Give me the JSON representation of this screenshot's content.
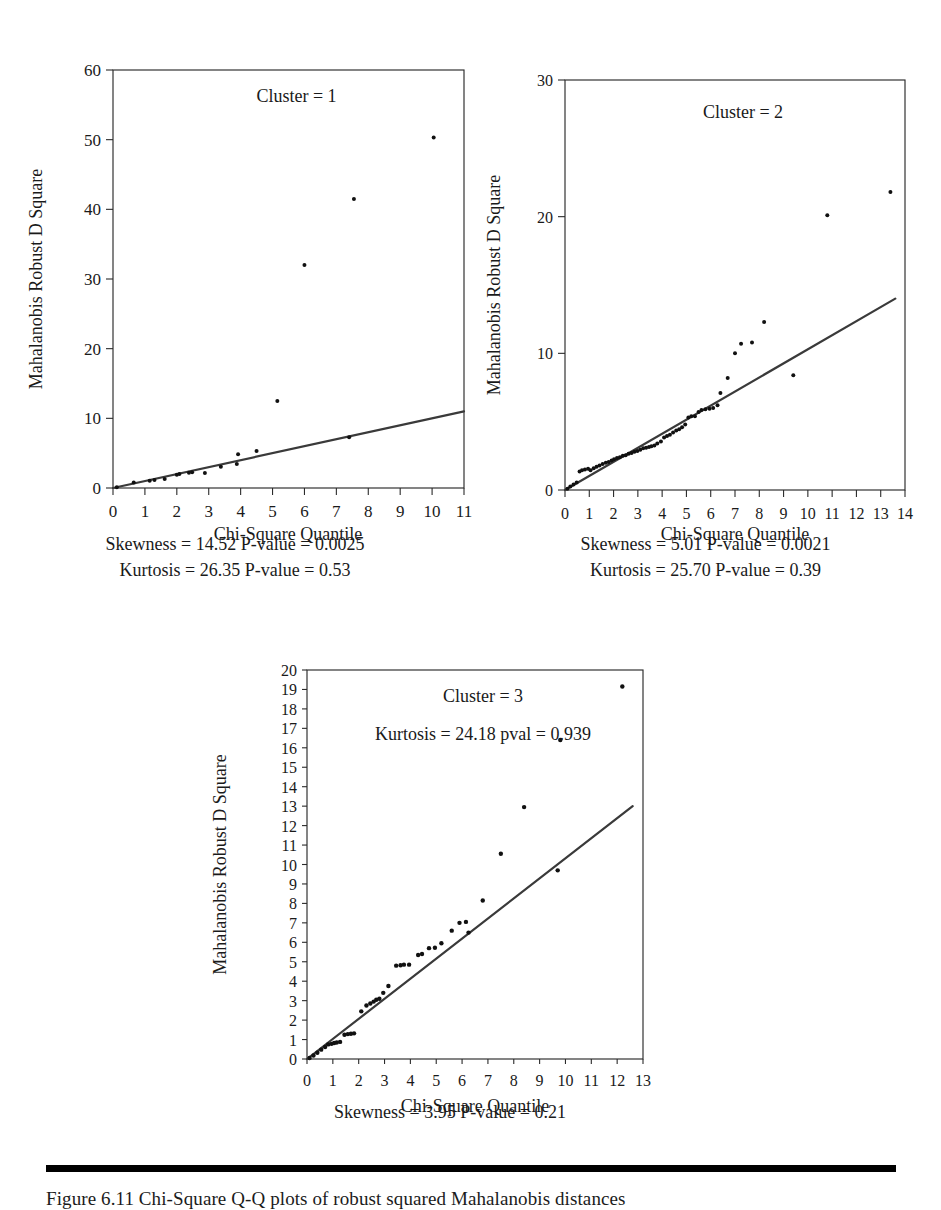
{
  "figure": {
    "background_color": "#ffffff",
    "ink_color": "#1a1a1a",
    "point_color": "#111111",
    "line_color": "#3a3a3a",
    "caption_rule_color": "#000000",
    "caption_text": "Figure 6.11   Chi-Square Q-Q plots of robust squared Mahalanobis distances"
  },
  "chart_data": [
    {
      "id": "cluster-1",
      "type": "scatter",
      "title": "Cluster = 1",
      "xlabel": "Chi-Square Quantile",
      "ylabel": "Mahalanobis Robust D Square",
      "xlim": [
        0,
        11
      ],
      "ylim": [
        0,
        60
      ],
      "xticks": [
        0,
        1,
        2,
        3,
        4,
        5,
        6,
        7,
        8,
        9,
        10,
        11
      ],
      "xtick_labels": [
        "0",
        "1",
        "2",
        "3",
        "4",
        "5",
        "6",
        "7",
        "8",
        "9",
        "10",
        "11"
      ],
      "yticks": [
        0,
        10,
        20,
        30,
        40,
        50,
        60
      ],
      "ytick_labels": [
        "0",
        "10",
        "20",
        "30",
        "40",
        "50",
        "60"
      ],
      "grid": false,
      "legend": "none",
      "reference_line": {
        "x": [
          0,
          11
        ],
        "y": [
          0,
          11
        ],
        "label": "45-degree reference line"
      },
      "points": [
        {
          "x": 0.12,
          "y": 0.1
        },
        {
          "x": 0.65,
          "y": 0.8
        },
        {
          "x": 1.15,
          "y": 1.05
        },
        {
          "x": 1.3,
          "y": 1.15
        },
        {
          "x": 1.62,
          "y": 1.3
        },
        {
          "x": 2.0,
          "y": 1.9
        },
        {
          "x": 2.08,
          "y": 2.0
        },
        {
          "x": 2.38,
          "y": 2.2
        },
        {
          "x": 2.48,
          "y": 2.25
        },
        {
          "x": 2.88,
          "y": 2.15
        },
        {
          "x": 3.38,
          "y": 3.05
        },
        {
          "x": 3.88,
          "y": 3.45
        },
        {
          "x": 3.92,
          "y": 4.85
        },
        {
          "x": 4.5,
          "y": 5.3
        },
        {
          "x": 5.15,
          "y": 12.5
        },
        {
          "x": 6.0,
          "y": 32.0
        },
        {
          "x": 7.4,
          "y": 7.3
        },
        {
          "x": 7.55,
          "y": 41.5
        },
        {
          "x": 10.05,
          "y": 50.3
        }
      ],
      "annotations": [
        {
          "text": "Skewness = 14.52   P-value = 0.0025"
        },
        {
          "text": "Kurtosis = 26.35   P-value = 0.53"
        }
      ]
    },
    {
      "id": "cluster-2",
      "type": "scatter",
      "title": "Cluster = 2",
      "xlabel": "Chi-Square Quantile",
      "ylabel": "Mahalanobis Robust D Square",
      "xlim": [
        0,
        14
      ],
      "ylim": [
        0,
        30
      ],
      "xticks": [
        0,
        1,
        2,
        3,
        4,
        5,
        6,
        7,
        8,
        9,
        10,
        11,
        12,
        13,
        14
      ],
      "xtick_labels": [
        "0",
        "1",
        "2",
        "3",
        "4",
        "5",
        "6",
        "7",
        "8",
        "9",
        "10",
        "11",
        "12",
        "13",
        "14"
      ],
      "yticks": [
        0,
        10,
        20,
        30
      ],
      "ytick_labels": [
        "0",
        "10",
        "20",
        "30"
      ],
      "grid": false,
      "legend": "none",
      "reference_line": {
        "x": [
          0,
          13.6
        ],
        "y": [
          0,
          14.0
        ],
        "label": "45-degree reference line"
      },
      "points": [
        {
          "x": 0.1,
          "y": 0.1
        },
        {
          "x": 0.22,
          "y": 0.25
        },
        {
          "x": 0.35,
          "y": 0.4
        },
        {
          "x": 0.48,
          "y": 0.55
        },
        {
          "x": 0.6,
          "y": 1.35
        },
        {
          "x": 0.7,
          "y": 1.45
        },
        {
          "x": 0.82,
          "y": 1.5
        },
        {
          "x": 0.95,
          "y": 1.55
        },
        {
          "x": 1.05,
          "y": 1.45
        },
        {
          "x": 1.18,
          "y": 1.6
        },
        {
          "x": 1.3,
          "y": 1.7
        },
        {
          "x": 1.42,
          "y": 1.8
        },
        {
          "x": 1.55,
          "y": 1.9
        },
        {
          "x": 1.68,
          "y": 2.0
        },
        {
          "x": 1.8,
          "y": 2.05
        },
        {
          "x": 1.92,
          "y": 2.15
        },
        {
          "x": 2.02,
          "y": 2.25
        },
        {
          "x": 2.14,
          "y": 2.35
        },
        {
          "x": 2.26,
          "y": 2.4
        },
        {
          "x": 2.38,
          "y": 2.5
        },
        {
          "x": 2.5,
          "y": 2.55
        },
        {
          "x": 2.62,
          "y": 2.65
        },
        {
          "x": 2.74,
          "y": 2.7
        },
        {
          "x": 2.86,
          "y": 2.8
        },
        {
          "x": 2.98,
          "y": 2.85
        },
        {
          "x": 3.1,
          "y": 2.95
        },
        {
          "x": 3.22,
          "y": 3.05
        },
        {
          "x": 3.34,
          "y": 3.1
        },
        {
          "x": 3.46,
          "y": 3.15
        },
        {
          "x": 3.56,
          "y": 3.2
        },
        {
          "x": 3.68,
          "y": 3.25
        },
        {
          "x": 3.8,
          "y": 3.4
        },
        {
          "x": 3.95,
          "y": 3.55
        },
        {
          "x": 4.08,
          "y": 3.85
        },
        {
          "x": 4.2,
          "y": 3.95
        },
        {
          "x": 4.32,
          "y": 4.05
        },
        {
          "x": 4.45,
          "y": 4.2
        },
        {
          "x": 4.58,
          "y": 4.35
        },
        {
          "x": 4.7,
          "y": 4.45
        },
        {
          "x": 4.82,
          "y": 4.6
        },
        {
          "x": 4.95,
          "y": 4.8
        },
        {
          "x": 5.08,
          "y": 5.3
        },
        {
          "x": 5.2,
          "y": 5.4
        },
        {
          "x": 5.35,
          "y": 5.4
        },
        {
          "x": 5.5,
          "y": 5.7
        },
        {
          "x": 5.62,
          "y": 5.85
        },
        {
          "x": 5.78,
          "y": 5.9
        },
        {
          "x": 5.95,
          "y": 5.95
        },
        {
          "x": 6.1,
          "y": 6.0
        },
        {
          "x": 6.28,
          "y": 6.2
        },
        {
          "x": 6.4,
          "y": 7.1
        },
        {
          "x": 6.7,
          "y": 8.2
        },
        {
          "x": 7.0,
          "y": 10.0
        },
        {
          "x": 7.25,
          "y": 10.7
        },
        {
          "x": 7.7,
          "y": 10.8
        },
        {
          "x": 8.2,
          "y": 12.3
        },
        {
          "x": 9.4,
          "y": 8.4
        },
        {
          "x": 10.8,
          "y": 20.1
        },
        {
          "x": 13.4,
          "y": 21.8
        }
      ],
      "annotations": [
        {
          "text": "Skewness = 5.01   P-value = 0.0021"
        },
        {
          "text": "Kurtosis = 25.70   P-value = 0.39"
        }
      ]
    },
    {
      "id": "cluster-3",
      "type": "scatter",
      "title": "Cluster = 3",
      "subtitle": "Kurtosis = 24.18 pval = 0.939",
      "xlabel": "Chi-Square Quantile",
      "ylabel": "Mahalanobis Robust D Square",
      "xlim": [
        0,
        13
      ],
      "ylim": [
        0,
        20
      ],
      "xticks": [
        0,
        1,
        2,
        3,
        4,
        5,
        6,
        7,
        8,
        9,
        10,
        11,
        12,
        13
      ],
      "xtick_labels": [
        "0",
        "1",
        "2",
        "3",
        "4",
        "5",
        "6",
        "7",
        "8",
        "9",
        "10",
        "11",
        "12",
        "13"
      ],
      "yticks": [
        0,
        1,
        2,
        3,
        4,
        5,
        6,
        7,
        8,
        9,
        10,
        11,
        12,
        13,
        14,
        15,
        16,
        17,
        18,
        19,
        20
      ],
      "ytick_labels": [
        "0",
        "1",
        "2",
        "3",
        "4",
        "5",
        "6",
        "7",
        "8",
        "9",
        "10",
        "11",
        "12",
        "13",
        "14",
        "15",
        "16",
        "17",
        "18",
        "19",
        "20"
      ],
      "grid": false,
      "legend": "none",
      "reference_line": {
        "x": [
          0,
          12.6
        ],
        "y": [
          0,
          13.0
        ],
        "label": "45-degree reference line"
      },
      "points": [
        {
          "x": 0.1,
          "y": 0.05
        },
        {
          "x": 0.25,
          "y": 0.18
        },
        {
          "x": 0.4,
          "y": 0.32
        },
        {
          "x": 0.55,
          "y": 0.48
        },
        {
          "x": 0.7,
          "y": 0.62
        },
        {
          "x": 0.82,
          "y": 0.75
        },
        {
          "x": 0.95,
          "y": 0.78
        },
        {
          "x": 1.05,
          "y": 0.82
        },
        {
          "x": 1.15,
          "y": 0.85
        },
        {
          "x": 1.28,
          "y": 0.88
        },
        {
          "x": 1.45,
          "y": 1.25
        },
        {
          "x": 1.58,
          "y": 1.28
        },
        {
          "x": 1.7,
          "y": 1.3
        },
        {
          "x": 1.82,
          "y": 1.32
        },
        {
          "x": 2.1,
          "y": 2.45
        },
        {
          "x": 2.3,
          "y": 2.75
        },
        {
          "x": 2.45,
          "y": 2.85
        },
        {
          "x": 2.58,
          "y": 2.95
        },
        {
          "x": 2.68,
          "y": 3.05
        },
        {
          "x": 2.8,
          "y": 3.1
        },
        {
          "x": 2.95,
          "y": 3.4
        },
        {
          "x": 3.15,
          "y": 3.75
        },
        {
          "x": 3.45,
          "y": 4.8
        },
        {
          "x": 3.62,
          "y": 4.82
        },
        {
          "x": 3.75,
          "y": 4.85
        },
        {
          "x": 3.95,
          "y": 4.85
        },
        {
          "x": 4.3,
          "y": 5.35
        },
        {
          "x": 4.45,
          "y": 5.4
        },
        {
          "x": 4.72,
          "y": 5.7
        },
        {
          "x": 4.95,
          "y": 5.72
        },
        {
          "x": 5.2,
          "y": 5.95
        },
        {
          "x": 5.6,
          "y": 6.6
        },
        {
          "x": 5.9,
          "y": 7.0
        },
        {
          "x": 6.15,
          "y": 7.05
        },
        {
          "x": 6.25,
          "y": 6.5
        },
        {
          "x": 6.8,
          "y": 8.15
        },
        {
          "x": 7.5,
          "y": 10.55
        },
        {
          "x": 8.4,
          "y": 12.95
        },
        {
          "x": 9.7,
          "y": 9.7
        },
        {
          "x": 9.8,
          "y": 16.4
        },
        {
          "x": 12.2,
          "y": 19.15
        }
      ],
      "annotations": [
        {
          "text": "Skewness = 3.95   P-value = 0.21"
        }
      ]
    }
  ]
}
